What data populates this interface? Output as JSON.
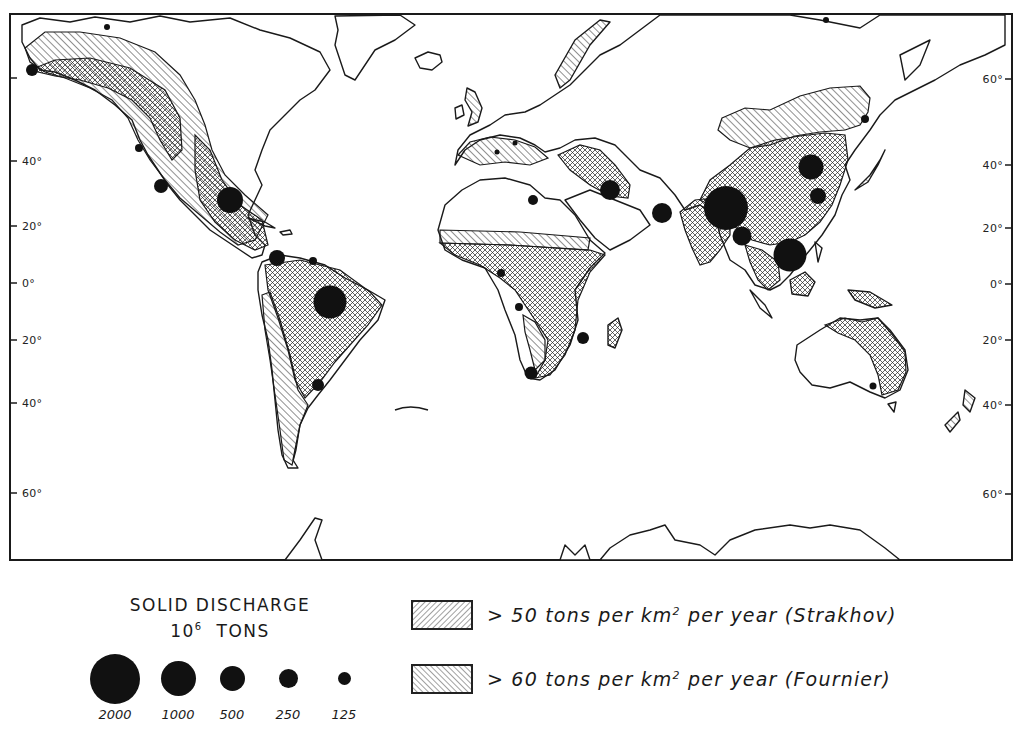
{
  "figure": {
    "type": "world-map",
    "projection": "Mercator-like, Atlantic-centered",
    "frame": {
      "left": 8,
      "top": 13,
      "width": 1005,
      "height": 548
    }
  },
  "latitude_labels": {
    "left": [
      {
        "label": "40°",
        "y": 161
      },
      {
        "label": "20°",
        "y": 226
      },
      {
        "label": "0°",
        "y": 283
      },
      {
        "label": "20°",
        "y": 340
      },
      {
        "label": "40°",
        "y": 403
      },
      {
        "label": "60°",
        "y": 493
      }
    ],
    "right": [
      {
        "label": "60°",
        "y": 79
      },
      {
        "label": "40°",
        "y": 165
      },
      {
        "label": "20°",
        "y": 228
      },
      {
        "label": "0°",
        "y": 284
      },
      {
        "label": "20°",
        "y": 340
      },
      {
        "label": "40°",
        "y": 405
      },
      {
        "label": "60°",
        "y": 494
      }
    ]
  },
  "legend": {
    "discharge": {
      "title_line1": "SOLID DISCHARGE",
      "title_line2_base": "10",
      "title_line2_exp": "6",
      "title_line2_unit": "TONS",
      "sizes": [
        {
          "value": "2000",
          "diameter": 50,
          "x": 0
        },
        {
          "value": "1000",
          "diameter": 35,
          "x": 70
        },
        {
          "value": "500",
          "diameter": 25,
          "x": 130
        },
        {
          "value": "250",
          "diameter": 19,
          "x": 186
        },
        {
          "value": "125",
          "diameter": 13,
          "x": 240
        }
      ]
    },
    "areas": [
      {
        "id": "strakhov",
        "prefix": "> 50 tons per km",
        "exp": "2",
        "suffix": " per year (Strakhov)",
        "pattern": "forward-hatch"
      },
      {
        "id": "fournier",
        "prefix": "> 60 tons per km",
        "exp": "2",
        "suffix": " per year (Fournier)",
        "pattern": "back-hatch"
      }
    ]
  },
  "discharge_points": [
    {
      "region": "Alaska (Yukon)",
      "x": 32,
      "y": 70,
      "d": 12
    },
    {
      "region": "Columbia",
      "x": 139,
      "y": 148,
      "d": 8
    },
    {
      "region": "Colorado",
      "x": 161,
      "y": 186,
      "d": 14
    },
    {
      "region": "Mississippi",
      "x": 230,
      "y": 200,
      "d": 26
    },
    {
      "region": "Magdalena/Orinoco",
      "x": 277,
      "y": 258,
      "d": 16
    },
    {
      "region": "Orinoco/Guiana",
      "x": 313,
      "y": 261,
      "d": 8
    },
    {
      "region": "Amazon",
      "x": 330,
      "y": 302,
      "d": 33
    },
    {
      "region": "Parana/La Plata",
      "x": 318,
      "y": 385,
      "d": 12
    },
    {
      "region": "Nile",
      "x": 533,
      "y": 200,
      "d": 10
    },
    {
      "region": "Tigris-Euphrates",
      "x": 610,
      "y": 190,
      "d": 20
    },
    {
      "region": "Indus",
      "x": 662,
      "y": 213,
      "d": 20
    },
    {
      "region": "Ganges-Brahmaputra",
      "x": 726,
      "y": 208,
      "d": 44
    },
    {
      "region": "Irrawaddy",
      "x": 742,
      "y": 236,
      "d": 19
    },
    {
      "region": "Mekong",
      "x": 790,
      "y": 255,
      "d": 33
    },
    {
      "region": "Huang He",
      "x": 811,
      "y": 167,
      "d": 25
    },
    {
      "region": "Yangtze",
      "x": 818,
      "y": 196,
      "d": 16
    },
    {
      "region": "Amur",
      "x": 865,
      "y": 119,
      "d": 8
    },
    {
      "region": "Niger",
      "x": 501,
      "y": 273,
      "d": 8
    },
    {
      "region": "Congo",
      "x": 519,
      "y": 307,
      "d": 8
    },
    {
      "region": "Zambezi",
      "x": 583,
      "y": 338,
      "d": 12
    },
    {
      "region": "Orange",
      "x": 531,
      "y": 373,
      "d": 13
    },
    {
      "region": "Murray",
      "x": 873,
      "y": 386,
      "d": 7
    },
    {
      "region": "Rhone",
      "x": 497,
      "y": 152,
      "d": 5
    },
    {
      "region": "Po",
      "x": 515,
      "y": 143,
      "d": 5
    },
    {
      "region": "Arctic (NA)",
      "x": 107,
      "y": 27,
      "d": 6
    },
    {
      "region": "Arctic (Asia)",
      "x": 826,
      "y": 20,
      "d": 6
    }
  ],
  "colors": {
    "ink": "#1a1a1a",
    "paper": "#ffffff",
    "dot": "#111111"
  }
}
